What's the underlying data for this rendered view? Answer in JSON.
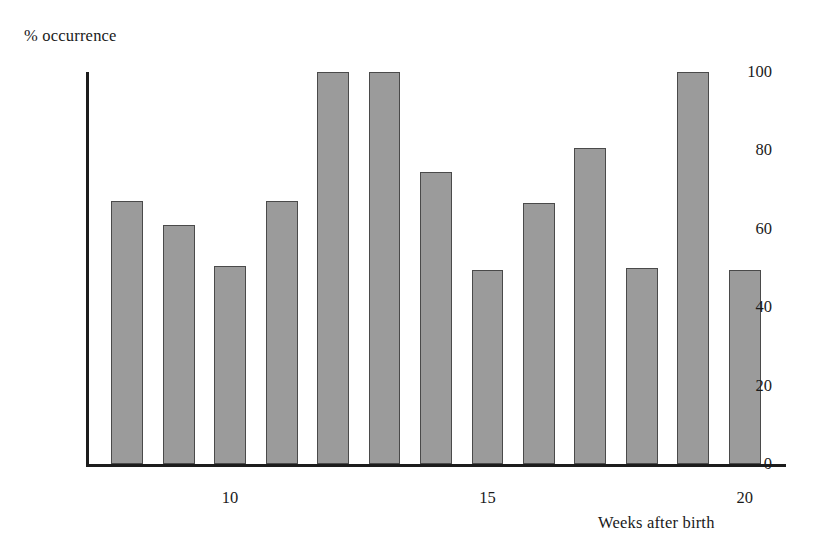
{
  "chart_data": {
    "type": "bar",
    "title": "",
    "subtitle": "",
    "xlabel": "Weeks after birth",
    "ylabel": "% occurrence",
    "categories": [
      8,
      9,
      10,
      11,
      12,
      13,
      14,
      15,
      16,
      17,
      18,
      19,
      20
    ],
    "values": [
      67,
      61,
      50.5,
      67,
      100,
      100,
      74.5,
      49.5,
      66.5,
      80.5,
      50,
      100,
      49.5
    ],
    "series": [
      {
        "name": "% occurrence",
        "values": [
          67,
          61,
          50.5,
          67,
          100,
          100,
          74.5,
          49.5,
          66.5,
          80.5,
          50,
          100,
          49.5
        ]
      }
    ],
    "xlim": [
      7.2,
      20.8
    ],
    "ylim": [
      0,
      100
    ],
    "yticks": [
      0,
      20,
      40,
      60,
      80,
      100
    ],
    "ytick_labels": [
      "0",
      "20",
      "40",
      "60",
      "80",
      "100"
    ],
    "xticks": [
      10,
      15,
      20
    ],
    "xtick_labels": [
      "10",
      "15",
      "20"
    ],
    "grid": false,
    "legend": "none",
    "bar_fill_color": "#9b9b9b",
    "bar_edge_color": "#4a4a4a",
    "axis_color": "#1c1c1c",
    "background_color": "#ffffff"
  }
}
